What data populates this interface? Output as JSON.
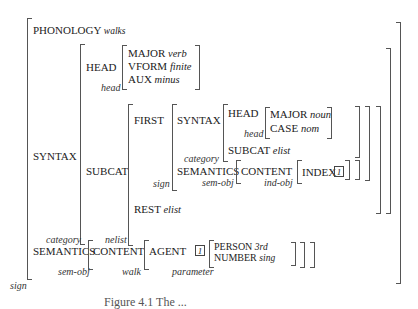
{
  "avm": {
    "type": "sign",
    "phonology": {
      "label": "PHONOLOGY",
      "value": "walks"
    },
    "syntax": {
      "label": "SYNTAX",
      "type": "category",
      "head": {
        "label": "HEAD",
        "type": "head",
        "features": [
          {
            "label": "MAJOR",
            "value": "verb"
          },
          {
            "label": "VFORM",
            "value": "finite"
          },
          {
            "label": "AUX",
            "value": "minus"
          }
        ]
      },
      "subcat": {
        "label": "SUBCAT",
        "type": "nelist",
        "first": {
          "label": "FIRST",
          "type": "sign",
          "syntax": {
            "label": "SYNTAX",
            "type": "category",
            "head": {
              "label": "HEAD",
              "type": "head",
              "features": [
                {
                  "label": "MAJOR",
                  "value": "noun"
                },
                {
                  "label": "CASE",
                  "value": "nom"
                }
              ]
            },
            "subcat": {
              "label": "SUBCAT",
              "value": "elist"
            }
          },
          "semantics": {
            "label": "SEMANTICS",
            "type": "sem-obj",
            "content": {
              "label": "CONTENT",
              "type": "ind-obj",
              "index": {
                "label": "INDEX",
                "tag": "1"
              }
            }
          }
        },
        "rest": {
          "label": "REST",
          "value": "elist"
        }
      }
    },
    "semantics": {
      "label": "SEMANTICS",
      "type": "sem-obj",
      "content": {
        "label": "CONTENT",
        "type": "walk",
        "agent": {
          "label": "AGENT",
          "tag": "1",
          "type": "parameter",
          "features": [
            {
              "label": "PERSON",
              "value": "3rd"
            },
            {
              "label": "NUMBER",
              "value": "sing"
            }
          ]
        }
      }
    }
  },
  "caption": "Figure 4.1  The ..."
}
